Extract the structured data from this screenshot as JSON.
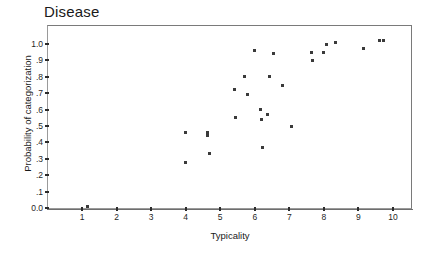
{
  "chart_data": {
    "type": "scatter",
    "title": "Disease",
    "xlabel": "Typicality",
    "ylabel": "Probability of categorization",
    "xlim": [
      0.35,
      10.6
    ],
    "ylim": [
      -0.08,
      1.09
    ],
    "grid": false,
    "legend": null,
    "xticks": [
      1,
      2,
      3,
      4,
      5,
      6,
      7,
      8,
      9,
      10
    ],
    "xtick_labels": [
      "1",
      "2",
      "3",
      "4",
      "5",
      "6",
      "7",
      "8",
      "9",
      "10"
    ],
    "yticks": [
      0.0,
      0.1,
      0.2,
      0.3,
      0.4,
      0.5,
      0.6,
      0.7,
      0.8,
      0.9,
      1.0
    ],
    "ytick_labels": [
      "0.0",
      ".1",
      ".2",
      ".3",
      ".4",
      ".5",
      ".6",
      ".7",
      ".8",
      ".9",
      "1.0"
    ],
    "marker": "square",
    "marker_color": "#3a3a3a",
    "points": [
      {
        "x": 1.15,
        "y": 0.01
      },
      {
        "x": 3.99,
        "y": 0.46
      },
      {
        "x": 4.0,
        "y": 0.28
      },
      {
        "x": 4.62,
        "y": 0.46
      },
      {
        "x": 4.64,
        "y": 0.44
      },
      {
        "x": 4.7,
        "y": 0.33
      },
      {
        "x": 5.42,
        "y": 0.72
      },
      {
        "x": 5.43,
        "y": 0.55
      },
      {
        "x": 5.7,
        "y": 0.8
      },
      {
        "x": 5.78,
        "y": 0.69
      },
      {
        "x": 6.0,
        "y": 0.96
      },
      {
        "x": 6.18,
        "y": 0.6
      },
      {
        "x": 6.2,
        "y": 0.54
      },
      {
        "x": 6.22,
        "y": 0.37
      },
      {
        "x": 6.36,
        "y": 0.57
      },
      {
        "x": 6.44,
        "y": 0.8
      },
      {
        "x": 6.54,
        "y": 0.94
      },
      {
        "x": 6.8,
        "y": 0.75
      },
      {
        "x": 7.05,
        "y": 0.5
      },
      {
        "x": 7.65,
        "y": 0.95
      },
      {
        "x": 7.68,
        "y": 0.9
      },
      {
        "x": 7.98,
        "y": 0.95
      },
      {
        "x": 8.08,
        "y": 1.0
      },
      {
        "x": 8.35,
        "y": 1.01
      },
      {
        "x": 9.15,
        "y": 0.97
      },
      {
        "x": 9.62,
        "y": 1.02
      },
      {
        "x": 9.72,
        "y": 1.02
      }
    ]
  },
  "plot": {
    "title": "Disease",
    "x_axis_title": "Typicality",
    "y_axis_title": "Probability of categorization"
  }
}
